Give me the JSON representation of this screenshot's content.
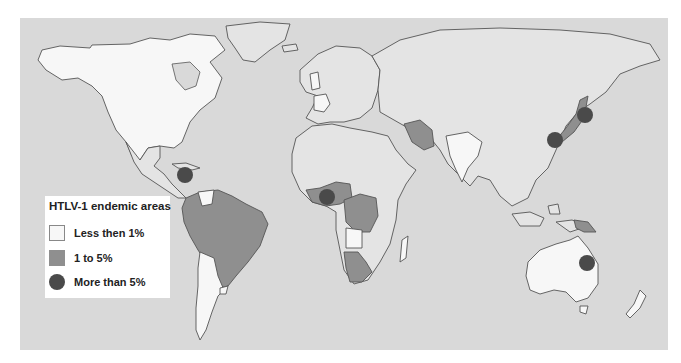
{
  "map": {
    "title": "HTLV-1 endemic areas",
    "colors": {
      "ocean": "#d9d9d9",
      "low": "#f7f7f7",
      "other_land": "#e4e4e4",
      "mid": "#8f8f8f",
      "high": "#4a4a4a"
    },
    "legend": {
      "title": "HTLV-1 endemic areas",
      "items": [
        {
          "label": "Less then 1%",
          "symbol": "white-square"
        },
        {
          "label": "1 to 5%",
          "symbol": "gray-square"
        },
        {
          "label": "More than 5%",
          "symbol": "dark-circle"
        }
      ]
    },
    "high_prevalence_markers": [
      {
        "region": "Caribbean",
        "x": 185,
        "y": 175
      },
      {
        "region": "West Africa",
        "x": 327,
        "y": 197
      },
      {
        "region": "Southern Japan",
        "x": 555,
        "y": 140
      },
      {
        "region": "Northern Japan",
        "x": 585,
        "y": 115
      },
      {
        "region": "Northeast Australia",
        "x": 587,
        "y": 263
      }
    ]
  }
}
